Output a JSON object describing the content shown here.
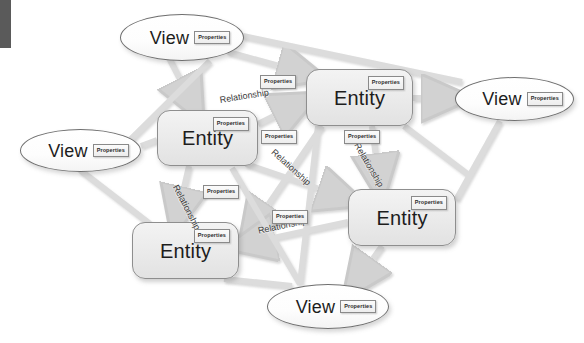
{
  "diagram": {
    "background_color": "#ffffff",
    "corner_bar_color": "#5a5a5a",
    "edge_color": "#d9d9d9",
    "node_border_color": "#8e8e8e",
    "entity_fill": "#ebebeb",
    "view_fill": "#fdfdfd",
    "properties_label": "Properties",
    "relationship_label": "Relationship",
    "entity_label": "Entity",
    "view_label": "View"
  },
  "nodes": [
    {
      "id": "view-top",
      "type": "view",
      "label": "View",
      "properties": "Properties",
      "x": 120,
      "y": 14,
      "w": 124,
      "h": 47
    },
    {
      "id": "view-left",
      "type": "view",
      "label": "View",
      "properties": "Properties",
      "x": 20,
      "y": 129,
      "w": 121,
      "h": 43
    },
    {
      "id": "view-right",
      "type": "view",
      "label": "View",
      "properties": "Properties",
      "x": 455,
      "y": 77,
      "w": 119,
      "h": 44
    },
    {
      "id": "view-bottom",
      "type": "view",
      "label": "View",
      "properties": "Properties",
      "x": 267,
      "y": 284,
      "w": 122,
      "h": 45
    },
    {
      "id": "entity-left",
      "type": "entity",
      "label": "Entity",
      "properties": "Properties",
      "x": 157,
      "y": 110,
      "w": 101,
      "h": 56
    },
    {
      "id": "entity-top",
      "type": "entity",
      "label": "Entity",
      "properties": "Properties",
      "x": 306,
      "y": 69,
      "w": 107,
      "h": 57
    },
    {
      "id": "entity-right",
      "type": "entity",
      "label": "Entity",
      "properties": "Properties",
      "x": 348,
      "y": 189,
      "w": 108,
      "h": 57
    },
    {
      "id": "entity-bottom",
      "type": "entity",
      "label": "Entity",
      "properties": "Properties",
      "x": 132,
      "y": 222,
      "w": 107,
      "h": 57
    }
  ],
  "edge_labels": [
    {
      "id": "rel-1",
      "text": "Relationship",
      "x": 219,
      "y": 95,
      "rotate": -9,
      "properties": "Properties",
      "px": 260,
      "py": 75
    },
    {
      "id": "rel-2",
      "text": "Relationship",
      "x": 276,
      "y": 147,
      "rotate": 42,
      "properties": "Properties",
      "px": 261,
      "py": 130
    },
    {
      "id": "rel-3",
      "text": "Relationship",
      "x": 361,
      "y": 141,
      "rotate": 60,
      "properties": "Properties",
      "px": 344,
      "py": 130
    },
    {
      "id": "rel-4",
      "text": "Relationship",
      "x": 180,
      "y": 183,
      "rotate": 63,
      "properties": "Properties",
      "px": 203,
      "py": 185
    },
    {
      "id": "rel-5",
      "text": "Relationship",
      "x": 257,
      "y": 226,
      "rotate": -12,
      "properties": "Properties",
      "px": 272,
      "py": 210
    }
  ],
  "edges": [
    {
      "from": "view-top",
      "to": "entity-left",
      "arrow": true
    },
    {
      "from": "view-top",
      "to": "entity-top",
      "arrow": true
    },
    {
      "from": "view-top",
      "to": "view-right",
      "arrow": false
    },
    {
      "from": "entity-left",
      "to": "entity-top",
      "arrow": true
    },
    {
      "from": "entity-left",
      "to": "entity-right",
      "arrow": true
    },
    {
      "from": "entity-left",
      "to": "entity-bottom",
      "arrow": true
    },
    {
      "from": "entity-left",
      "to": "view-left",
      "arrow": false
    },
    {
      "from": "entity-top",
      "to": "view-right",
      "arrow": true
    },
    {
      "from": "entity-top",
      "to": "entity-right",
      "arrow": true
    },
    {
      "from": "entity-top",
      "to": "entity-bottom",
      "arrow": true
    },
    {
      "from": "entity-right",
      "to": "entity-bottom",
      "arrow": true
    },
    {
      "from": "entity-right",
      "to": "view-bottom",
      "arrow": true
    },
    {
      "from": "entity-right",
      "to": "view-right",
      "arrow": false
    },
    {
      "from": "view-left",
      "to": "entity-bottom",
      "arrow": true
    },
    {
      "from": "view-bottom",
      "to": "entity-bottom",
      "arrow": false
    },
    {
      "from": "view-bottom",
      "to": "entity-left",
      "arrow": false
    }
  ]
}
